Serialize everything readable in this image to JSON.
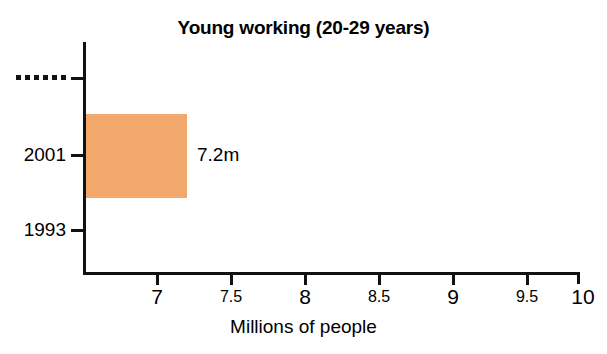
{
  "chart_data": {
    "type": "bar",
    "orientation": "horizontal",
    "title": "Young working (20-29 years)",
    "xlabel": "Millions of people",
    "ylabel": "",
    "categories": [
      "1993",
      "2001",
      "······"
    ],
    "values": [
      null,
      7.2,
      null
    ],
    "data_labels": [
      "",
      "7.2m",
      ""
    ],
    "xlim": [
      6.63,
      10
    ],
    "xticks": [
      7,
      7.5,
      8,
      8.5,
      9,
      9.5,
      10
    ],
    "xtick_labels": [
      "7",
      "7.5",
      "8",
      "8.5",
      "9",
      "9.5",
      "10"
    ],
    "ytick_labels": [
      "······",
      "2001",
      "1993"
    ],
    "grid": false,
    "legend": false,
    "series": [
      {
        "name": "Young working (20-29 years)",
        "color": "#F2A86B",
        "values": [
          {
            "category": "······",
            "value": null,
            "label": ""
          },
          {
            "category": "2001",
            "value": 7.2,
            "label": "7.2m"
          },
          {
            "category": "1993",
            "value": null,
            "label": ""
          }
        ]
      }
    ]
  },
  "colors": {
    "bar": "#F2A86B",
    "axis": "#111111",
    "text": "#000000",
    "background": "#ffffff"
  },
  "chart": {
    "title": "Young working (20-29 years)",
    "axis_title": "Millions of people",
    "bar_value_label": "7.2m",
    "y_labels": {
      "top_redacted": "······",
      "mid": "2001",
      "bottom": "1993"
    },
    "x_labels": {
      "t7": "7",
      "t75": "7.5",
      "t8": "8",
      "t85": "8.5",
      "t9": "9",
      "t95": "9.5",
      "t10": "10"
    }
  }
}
